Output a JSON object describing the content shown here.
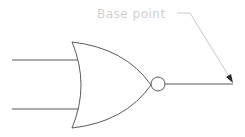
{
  "diagram": {
    "type": "logic-gate",
    "gate": "NOR",
    "inputs": 2,
    "outputs": 1,
    "annotation": {
      "label": "Base point",
      "target": "output-terminal"
    },
    "colors": {
      "lines": "#5a5a5a",
      "annotation": "#cfcfcf",
      "background": "#ffffff"
    }
  }
}
